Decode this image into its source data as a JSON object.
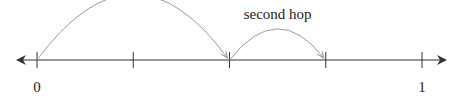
{
  "diagram": {
    "type": "number-line",
    "range": [
      0,
      1
    ],
    "tick_count": 5,
    "tick_values": [
      0,
      0.25,
      0.5,
      0.75,
      1
    ],
    "labels": [
      {
        "value": 0,
        "text": "0"
      },
      {
        "value": 1,
        "text": "1"
      }
    ],
    "hops": [
      {
        "name": "first-hop",
        "label": "first hop",
        "from": 0,
        "to": 0.5
      },
      {
        "name": "second-hop",
        "label": "second hop",
        "from": 0.5,
        "to": 0.75
      }
    ],
    "colors": {
      "line": "#333333",
      "arc": "#999999",
      "text": "#222222"
    }
  }
}
